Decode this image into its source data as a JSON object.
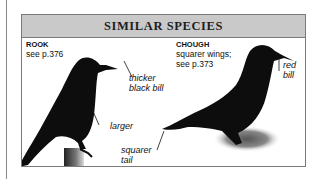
{
  "panel": {
    "title": "SIMILAR SPECIES"
  },
  "species": [
    {
      "name": "ROOK",
      "description": "see p.376",
      "labels": [
        "thicker",
        "black bill",
        "larger",
        "squarer",
        "tail"
      ]
    },
    {
      "name": "CHOUGH",
      "description_line1": "squarer wings;",
      "description_line2": "see p.373",
      "labels": [
        "red",
        "bill"
      ]
    }
  ],
  "colors": {
    "header_bg": "#c9c9c9",
    "border": "#7a7a7a",
    "bird": "#0d0d0d"
  }
}
